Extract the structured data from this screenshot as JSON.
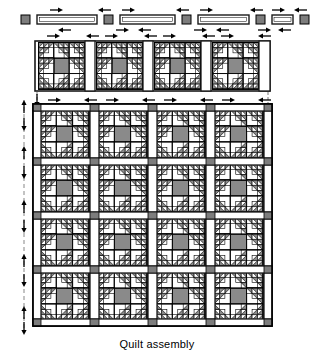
{
  "figure": {
    "caption": "Quilt assembly",
    "kind": "quilt-assembly-diagram"
  },
  "colors": {
    "background": "#ffffff",
    "line": "#000000",
    "sashing_fill": "#ffffff",
    "sashing_edge": "#1a1a1a",
    "cornerstone_fill": "#7d7d7d",
    "block_center_fill": "#8a8a8a",
    "triangle_fill": "#8a8a8a",
    "background_fill": "#ffffff",
    "arrow": "#000000",
    "guide_line": "#555555",
    "caption_text": "#000000"
  },
  "layout": {
    "canvas_width": 314,
    "canvas_height": 357,
    "columns": 4,
    "rows_in_body": 4,
    "exploded_top_block_row": 1,
    "exploded_top_sashing_row": 1,
    "total_block_rows": 5,
    "block_size_px": 48,
    "sashing_width_px": 6,
    "cornerstone_size_px": 6
  },
  "top_sashing_row": {
    "label": "top sashing strip row",
    "cornerstone_count": 5,
    "strip_count": 4,
    "strips": [
      {
        "name": "sashing-strip-1"
      },
      {
        "name": "sashing-strip-2"
      },
      {
        "name": "sashing-strip-3"
      },
      {
        "name": "sashing-strip-4"
      }
    ],
    "cornerstones": [
      {
        "name": "cornerstone-1"
      },
      {
        "name": "cornerstone-2"
      },
      {
        "name": "cornerstone-3"
      },
      {
        "name": "cornerstone-4"
      },
      {
        "name": "cornerstone-5"
      }
    ]
  },
  "top_block_row": {
    "label": "exploded top block row",
    "block_count": 4,
    "blocks": [
      {
        "name": "block-r0-c0"
      },
      {
        "name": "block-r0-c1"
      },
      {
        "name": "block-r0-c2"
      },
      {
        "name": "block-r0-c3"
      }
    ]
  },
  "quilt_body": {
    "label": "assembled quilt body",
    "rows": [
      {
        "name": "block-row-1",
        "blocks": [
          {
            "name": "block-r1-c0"
          },
          {
            "name": "block-r1-c1"
          },
          {
            "name": "block-r1-c2"
          },
          {
            "name": "block-r1-c3"
          }
        ]
      },
      {
        "name": "block-row-2",
        "blocks": [
          {
            "name": "block-r2-c0"
          },
          {
            "name": "block-r2-c1"
          },
          {
            "name": "block-r2-c2"
          },
          {
            "name": "block-r2-c3"
          }
        ]
      },
      {
        "name": "block-row-3",
        "blocks": [
          {
            "name": "block-r3-c0"
          },
          {
            "name": "block-r3-c1"
          },
          {
            "name": "block-r3-c2"
          },
          {
            "name": "block-r3-c3"
          }
        ]
      },
      {
        "name": "block-row-4",
        "blocks": [
          {
            "name": "block-r4-c0"
          },
          {
            "name": "block-r4-c1"
          },
          {
            "name": "block-r4-c2"
          },
          {
            "name": "block-r4-c3"
          }
        ]
      }
    ]
  },
  "annotations": {
    "top_arrow_pairs": 10,
    "left_arrow_pairs": 5,
    "top_arrow_note": "pairs of short horizontal arrows pointing toward each seam",
    "left_arrow_note": "pairs of short vertical arrows pointing toward each horizontal seam",
    "guide_note": "dashed alignment guides at left edge and above top row"
  }
}
